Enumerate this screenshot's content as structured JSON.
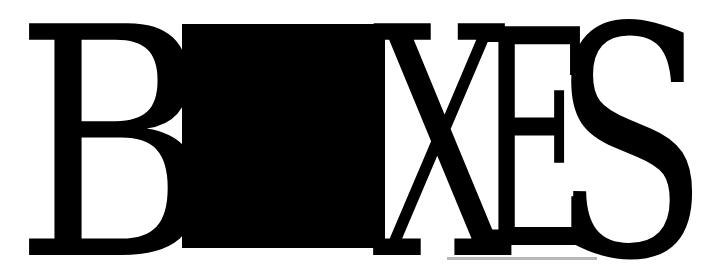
{
  "logo": {
    "letters": {
      "b": "B",
      "x": "X",
      "e": "E",
      "s": "S"
    },
    "square_color": "#000000",
    "text_color": "#000000",
    "underline_color": "#b8b8b8",
    "word": "BOXES"
  }
}
